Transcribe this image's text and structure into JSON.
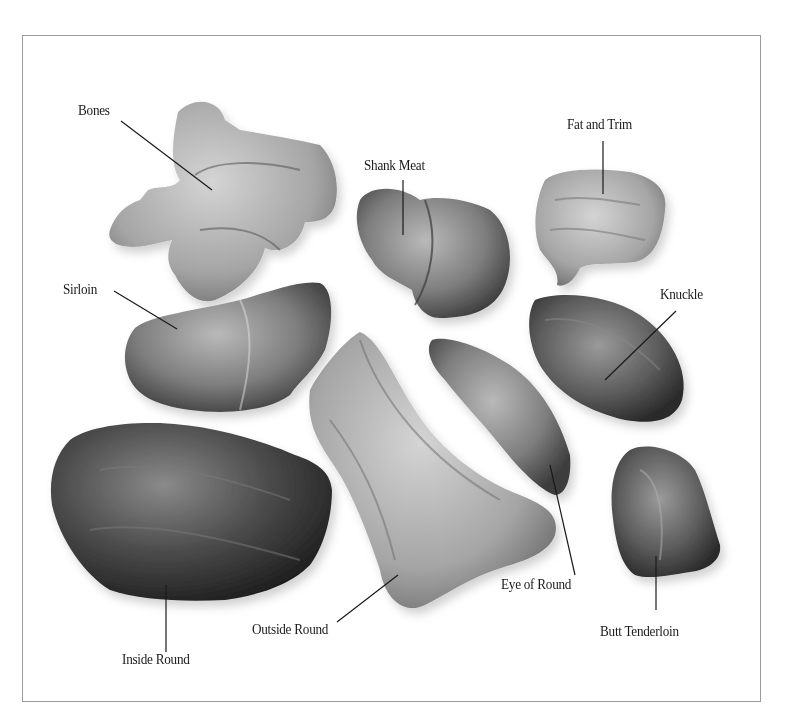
{
  "figure": {
    "colors": {
      "background": "#ffffff",
      "frame": "#9a9a9a",
      "leader_line": "#1a1a1a",
      "text": "#1a1a1a"
    }
  },
  "labels": {
    "bones": "Bones",
    "shank_meat": "Shank Meat",
    "fat_and_trim": "Fat and Trim",
    "sirloin": "Sirloin",
    "knuckle": "Knuckle",
    "inside_round": "Inside Round",
    "outside_round": "Outside Round",
    "eye_of_round": "Eye of Round",
    "butt_tenderloin": "Butt Tenderloin"
  }
}
